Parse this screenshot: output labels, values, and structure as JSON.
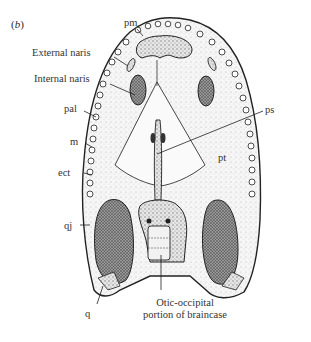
{
  "figure": {
    "panel_label": "b",
    "labels": {
      "pm": "pm",
      "external_naris": "External naris",
      "internal_naris": "Internal naris",
      "pal": "pal",
      "m": "m",
      "ect": "ect",
      "qj": "qj",
      "q": "q",
      "ps": "ps",
      "pt": "pt"
    },
    "caption_line1": "Otic-occipital",
    "caption_line2": "portion of braincase"
  }
}
